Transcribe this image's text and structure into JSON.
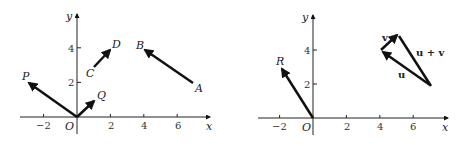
{
  "left_plot": {
    "axis_labels": {
      "x": "x",
      "y": "y",
      "origin": "O"
    },
    "x_ticks": [
      "−2",
      "2",
      "4",
      "6"
    ],
    "y_ticks": [
      "2",
      "4"
    ],
    "vectors": [
      {
        "name": "OP",
        "from": [
          0,
          0
        ],
        "to": [
          -3,
          2
        ],
        "label": "P"
      },
      {
        "name": "OQ",
        "from": [
          0,
          0
        ],
        "to": [
          1,
          1
        ],
        "label": "Q"
      },
      {
        "name": "CD",
        "from": [
          1,
          3
        ],
        "to": [
          2,
          4
        ],
        "labels": [
          "C",
          "D"
        ]
      },
      {
        "name": "AB",
        "from": [
          7,
          2
        ],
        "to": [
          4,
          4
        ],
        "labels": [
          "A",
          "B"
        ]
      }
    ]
  },
  "right_plot": {
    "axis_labels": {
      "x": "x",
      "y": "y",
      "origin": "O"
    },
    "x_ticks": [
      "−2",
      "2",
      "4",
      "6"
    ],
    "y_ticks": [
      "2",
      "4"
    ],
    "vectors": [
      {
        "name": "OR",
        "from": [
          0,
          0
        ],
        "to": [
          -2,
          3
        ],
        "label": "R"
      },
      {
        "name": "u",
        "from": [
          7,
          2
        ],
        "to": [
          4,
          4
        ],
        "label": "u"
      },
      {
        "name": "v",
        "from": [
          4,
          4
        ],
        "to": [
          5,
          5
        ],
        "label": "v"
      },
      {
        "name": "u+v",
        "from": [
          7,
          2
        ],
        "to": [
          5,
          5
        ],
        "label": "u + v"
      }
    ]
  }
}
